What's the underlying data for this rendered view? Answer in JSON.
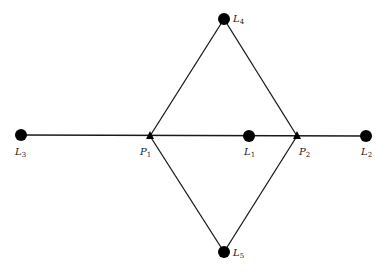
{
  "diagram": {
    "type": "network",
    "nodes": [
      {
        "id": "L3",
        "label": "L",
        "sub": "3",
        "shape": "dot",
        "x": 21,
        "y": 135,
        "lx": 15,
        "ly": 155
      },
      {
        "id": "P1",
        "label": "P",
        "sub": "1",
        "shape": "triangle",
        "x": 150,
        "y": 136,
        "lx": 140,
        "ly": 155
      },
      {
        "id": "L1",
        "label": "L",
        "sub": "1",
        "shape": "dot",
        "x": 249,
        "y": 136,
        "lx": 244,
        "ly": 155
      },
      {
        "id": "P2",
        "label": "P",
        "sub": "2",
        "shape": "triangle",
        "x": 297,
        "y": 136,
        "lx": 299,
        "ly": 155
      },
      {
        "id": "L2",
        "label": "L",
        "sub": "2",
        "shape": "dot",
        "x": 366,
        "y": 136,
        "lx": 361,
        "ly": 155
      },
      {
        "id": "L4",
        "label": "L",
        "sub": "4",
        "shape": "dot",
        "x": 224,
        "y": 19,
        "lx": 233,
        "ly": 22
      },
      {
        "id": "L5",
        "label": "L",
        "sub": "5",
        "shape": "dot",
        "x": 224,
        "y": 252,
        "lx": 233,
        "ly": 256
      }
    ],
    "edges": [
      {
        "from": "L3",
        "to": "L2"
      },
      {
        "from": "P1",
        "to": "L4"
      },
      {
        "from": "L4",
        "to": "P2"
      },
      {
        "from": "P1",
        "to": "L5"
      },
      {
        "from": "L5",
        "to": "P2"
      }
    ]
  }
}
